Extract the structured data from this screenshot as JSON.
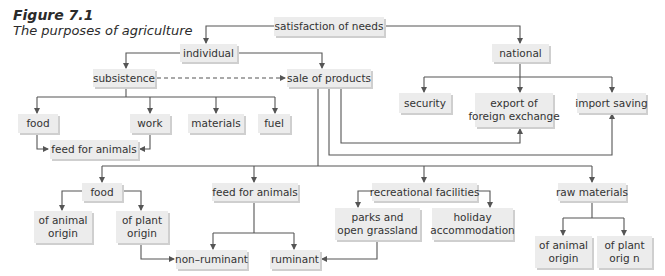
{
  "figure": {
    "label": "Figure 7.1",
    "caption": "The purposes of agriculture"
  },
  "colors": {
    "box_fill": "#ececec",
    "box_shadow": "#cfcfcf",
    "line": "#555555",
    "text": "#333333"
  },
  "nodes": {
    "satisfaction": "satisfaction of needs",
    "individual": "individual",
    "national": "national",
    "subsistence": "subsistence",
    "sale": "sale of products",
    "food_top": "food",
    "work": "work",
    "materials": "materials",
    "fuel": "fuel",
    "security": "security",
    "export_l1": "export of",
    "export_l2": "foreign exchange",
    "import_saving": "import saving",
    "feed_top": "feed for animals",
    "food_low": "food",
    "feed_low": "feed for animals",
    "recreational": "recreational facilities",
    "raw_materials": "raw materials",
    "animal_origin_l1": "of animal",
    "animal_origin_l2": "origin",
    "plant_origin_l1": "of plant",
    "plant_origin_l2": "origin",
    "parks_l1": "parks and",
    "parks_l2": "open grassland",
    "holiday_l1": "holiday",
    "holiday_l2": "accommodation",
    "non_ruminant": "non–ruminant",
    "ruminant": "ruminant",
    "raw_animal_l1": "of animal",
    "raw_animal_l2": "origin",
    "raw_plant_l1": "of plant",
    "raw_plant_l2": "orig n"
  }
}
